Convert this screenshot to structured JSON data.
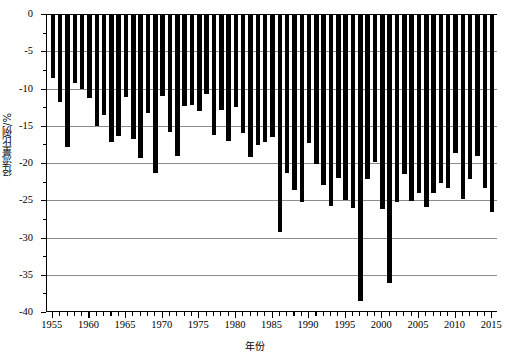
{
  "chart_data": {
    "type": "bar",
    "title": "",
    "subtitle": "",
    "xlabel": "年份",
    "ylabel": "径流量比例/%",
    "xlim": [
      1954.2,
      2015.8
    ],
    "ylim": [
      -40,
      0
    ],
    "grid": true,
    "legend": null,
    "bar_color": "#000000",
    "grid_color": "#8c8c8c",
    "y_ticks": [
      0,
      -5,
      -10,
      -15,
      -20,
      -25,
      -30,
      -35,
      -40
    ],
    "y_tick_labels": [
      "0",
      "-5",
      "-10",
      "-15",
      "-20",
      "-25",
      "-30",
      "-35",
      "-40"
    ],
    "x_ticks": [
      1955,
      1960,
      1965,
      1970,
      1975,
      1980,
      1985,
      1990,
      1995,
      2000,
      2005,
      2010,
      2015
    ],
    "x_tick_labels": [
      "1955",
      "1960",
      "1965",
      "1970",
      "1975",
      "1980",
      "1985",
      "1990",
      "1995",
      "2000",
      "2005",
      "2010",
      "2015"
    ],
    "x_minor_tick_step": 1,
    "categories": [
      1955,
      1956,
      1957,
      1958,
      1959,
      1960,
      1961,
      1962,
      1963,
      1964,
      1965,
      1966,
      1967,
      1968,
      1969,
      1970,
      1971,
      1972,
      1973,
      1974,
      1975,
      1976,
      1977,
      1978,
      1979,
      1980,
      1981,
      1982,
      1983,
      1984,
      1985,
      1986,
      1987,
      1988,
      1989,
      1990,
      1991,
      1992,
      1993,
      1994,
      1995,
      1996,
      1997,
      1998,
      1999,
      2000,
      2001,
      2002,
      2003,
      2004,
      2005,
      2006,
      2007,
      2008,
      2009,
      2010,
      2011,
      2012,
      2013,
      2014,
      2015
    ],
    "values": [
      -8.6,
      -11.8,
      -17.8,
      -9.2,
      -10.1,
      -11.3,
      -15.1,
      -13.5,
      -17.2,
      -16.4,
      -11.2,
      -16.8,
      -19.3,
      -13.3,
      -21.4,
      -11.0,
      -15.8,
      -19.1,
      -12.4,
      -12.2,
      -13.0,
      -10.8,
      -16.2,
      -12.9,
      -17.0,
      -12.5,
      -16.0,
      -19.2,
      -17.6,
      -17.2,
      -16.5,
      -29.2,
      -21.3,
      -23.6,
      -25.2,
      -17.3,
      -20.1,
      -23.0,
      -25.8,
      -22.0,
      -24.9,
      -26.1,
      -38.5,
      -22.2,
      -19.8,
      -26.2,
      -36.1,
      -25.2,
      -21.5,
      -25.1,
      -24.0,
      -25.9,
      -24.0,
      -22.7,
      -23.4,
      -18.6,
      -24.8,
      -22.2,
      -19.1,
      -23.4,
      -26.6
    ]
  }
}
